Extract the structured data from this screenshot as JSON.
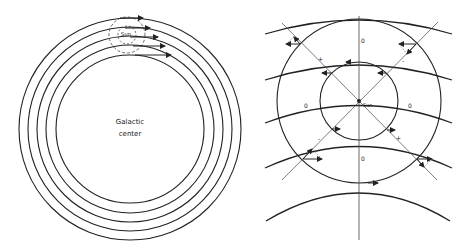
{
  "left_figure": {
    "title": "Concentric galactic orbits near the Sun",
    "center_label_line1": "Galactic",
    "center_label_line2": "center",
    "sun_label": "Sun",
    "center": [
      130,
      129
    ],
    "orbit_radii": [
      111,
      102,
      93,
      84,
      74
    ],
    "arrow_tips_x": [
      143,
      150,
      158,
      165,
      171
    ],
    "sun_position": [
      127,
      35
    ],
    "dashed_circle_radii": [
      9,
      18
    ]
  },
  "right_figure": {
    "title": "Differential rotation seen from the Sun",
    "sun_label": "Sun",
    "sun_position": [
      359,
      101
    ],
    "outer_circle_radius": 82,
    "inner_circle_radius": 39,
    "zero_labels": [
      "0",
      "0",
      "0",
      "0"
    ],
    "sign_labels": [
      "+",
      "-",
      "+",
      "-"
    ],
    "plus_sign": "+",
    "minus_sign": "-"
  },
  "colors": {
    "line": "#222222",
    "background": "#ffffff"
  }
}
